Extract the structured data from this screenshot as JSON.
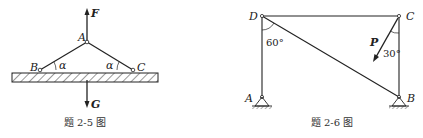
{
  "figures": [
    {
      "caption": "题 2-5 图",
      "labels": {
        "A": "A",
        "B": "B",
        "C": "C",
        "F": "F",
        "G": "G",
        "alpha_left": "α",
        "alpha_right": "α"
      }
    },
    {
      "caption": "题 2-6 图",
      "labels": {
        "A": "A",
        "B": "B",
        "C": "C",
        "D": "D",
        "P": "P",
        "angle_D": "60°",
        "angle_C": "30°"
      }
    }
  ]
}
